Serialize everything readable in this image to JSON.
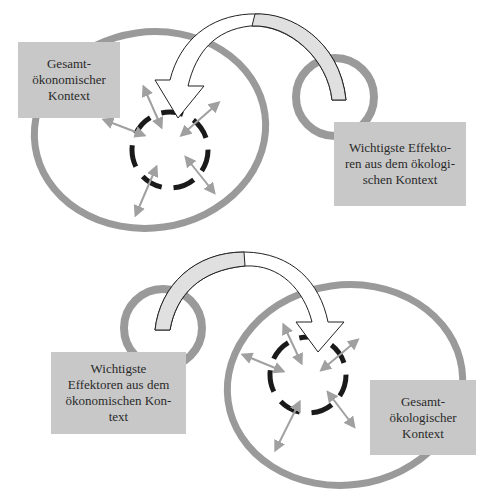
{
  "colors": {
    "ring": "#9a9a9a",
    "box_fill": "#c8c8c8",
    "dashed_circle": "#1a1a1a",
    "arrow_fill": "#ececec",
    "small_arrows": "#a0a0a0"
  },
  "top_panel": {
    "context_box": {
      "text": "Gesamt-\nökonomischer\nKontext"
    },
    "effector_box": {
      "text": "Wichtigste Effekto-\nren aus dem ökologi-\nschen Kontext"
    }
  },
  "bottom_panel": {
    "effector_box": {
      "text": "Wichtigste\nEffektoren aus dem\nökonomischen Kon-\ntext"
    },
    "context_box": {
      "text": "Gesamt-\nökologischer\nKontext"
    }
  }
}
